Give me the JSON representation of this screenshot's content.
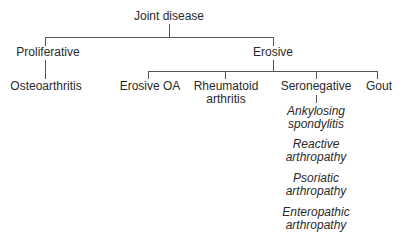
{
  "tree": {
    "root": "Joint disease",
    "level1": {
      "proliferative": "Proliferative",
      "erosive": "Erosive"
    },
    "proliferative_children": [
      "Osteoarthritis"
    ],
    "erosive_children": {
      "erosive_oa": "Erosive OA",
      "rheumatoid_l1": "Rheumatoid",
      "rheumatoid_l2": "arthritis",
      "seronegative": "Seronegative",
      "gout": "Gout"
    },
    "seronegative_children": [
      {
        "l1": "Ankylosing",
        "l2": "spondylitis"
      },
      {
        "l1": "Reactive",
        "l2": "arthropathy"
      },
      {
        "l1": "Psoriatic",
        "l2": "arthropathy"
      },
      {
        "l1": "Enteropathic",
        "l2": "arthropathy"
      }
    ]
  }
}
